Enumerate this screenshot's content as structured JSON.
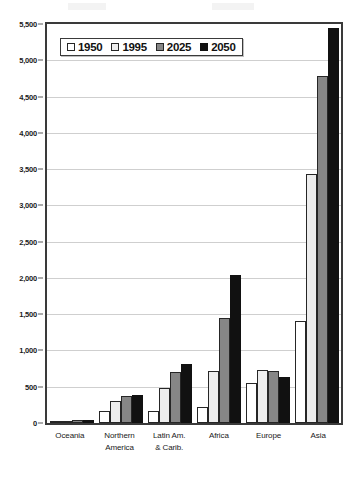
{
  "chart_data": {
    "type": "bar",
    "title": "",
    "subtitle": "",
    "xlabel": "",
    "ylabel": "",
    "ylim": [
      0,
      5500
    ],
    "ytick_step": 500,
    "yticks": [
      0,
      500,
      1000,
      1500,
      2000,
      2500,
      3000,
      3500,
      4000,
      4500,
      5000,
      5500
    ],
    "ytick_labels": [
      "0",
      "500",
      "1,000",
      "1,500",
      "2,000",
      "2,500",
      "3,000",
      "3,500",
      "4,000",
      "4,500",
      "5,000",
      "5,500"
    ],
    "grid": true,
    "grid_axis": "y",
    "legend_position": "top-left-inside",
    "categories": [
      "Oceania",
      "Northern America",
      "Latin Am. & Carib.",
      "Africa",
      "Europe",
      "Asia"
    ],
    "category_lines": [
      [
        "Oceania"
      ],
      [
        "Northern",
        "America"
      ],
      [
        "Latin Am.",
        "& Carib."
      ],
      [
        "Africa"
      ],
      [
        "Europe"
      ],
      [
        "Asia"
      ]
    ],
    "series": [
      {
        "name": "1950",
        "color": "#ffffff",
        "values": [
          13,
          172,
          167,
          221,
          547,
          1402
        ]
      },
      {
        "name": "1995",
        "color": "#ededed",
        "values": [
          28,
          297,
          482,
          719,
          727,
          3428
        ]
      },
      {
        "name": "2025",
        "color": "#868686",
        "values": [
          41,
          369,
          700,
          1454,
          718,
          4785
        ]
      },
      {
        "name": "2050",
        "color": "#111111",
        "values": [
          46,
          384,
          810,
          2046,
          638,
          5443
        ]
      }
    ]
  },
  "legend": {
    "items": [
      {
        "label": "1950",
        "swatch": "white-square-icon"
      },
      {
        "label": "1995",
        "swatch": "light-gray-square-icon"
      },
      {
        "label": "2025",
        "swatch": "gray-square-icon"
      },
      {
        "label": "2050",
        "swatch": "black-square-icon"
      }
    ]
  },
  "colors": {
    "axis": "#3a3a3a",
    "gridline": "#cfcfcf",
    "text": "#1a1a1a",
    "background": "#ffffff"
  }
}
